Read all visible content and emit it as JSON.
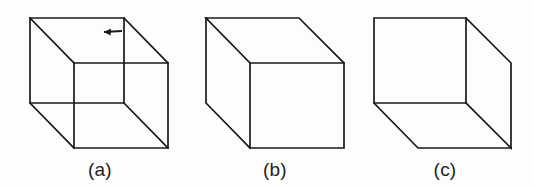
{
  "figure": {
    "background_color": "#fdfdfd",
    "line_color": "#1a1a1a",
    "width": 534,
    "height": 189
  },
  "panels": [
    {
      "id": "a",
      "caption": "(a)",
      "description": "Wireframe Necker cube with all twelve edges drawn, ambiguous depth",
      "annotation": {
        "type": "arrow",
        "direction": "left",
        "name": "vertex-pointer-arrow"
      },
      "geometry": {
        "front_face": {
          "x": 74,
          "y": 63,
          "width": 94,
          "height": 85
        },
        "back_face": {
          "x": 30,
          "y": 18,
          "width": 94,
          "height": 85
        },
        "offset": {
          "dx": -44,
          "dy": -45
        }
      }
    },
    {
      "id": "b",
      "caption": "(b)",
      "description": "Opaque cube with hidden edges removed, front face lower right",
      "annotation": null,
      "geometry": {
        "front_face": {
          "x": 250,
          "y": 63,
          "width": 94,
          "height": 85
        },
        "back_face": {
          "x": 206,
          "y": 18,
          "width": 94,
          "height": 85
        },
        "offset": {
          "dx": -44,
          "dy": -45
        }
      }
    },
    {
      "id": "c",
      "caption": "(c)",
      "description": "Opaque cube with hidden edges removed, front face upper left",
      "annotation": null,
      "geometry": {
        "front_face": {
          "x": 374,
          "y": 18,
          "width": 93,
          "height": 85
        },
        "back_face": {
          "x": 418,
          "y": 63,
          "width": 93,
          "height": 85
        },
        "offset": {
          "dx": 44,
          "dy": 45
        }
      }
    }
  ]
}
